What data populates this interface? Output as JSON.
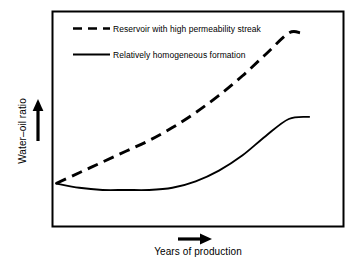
{
  "axes": {
    "y_label": "Water–oil ratio",
    "x_label": "Years of production",
    "y_arrow_icon": "arrow-up-icon",
    "x_arrow_icon": "arrow-right-icon"
  },
  "legend": {
    "entries": [
      {
        "label": "Reservoir with high permeability streak",
        "style": "dashed",
        "color": "#000000"
      },
      {
        "label": "Relatively homogeneous formation",
        "style": "solid",
        "color": "#000000"
      }
    ]
  },
  "chart_data": {
    "type": "line",
    "title": "",
    "subtitle": "",
    "xlabel": "Years of production",
    "ylabel": "Water–oil ratio",
    "xlim": [
      0,
      100
    ],
    "ylim": [
      0,
      100
    ],
    "grid": false,
    "axis_tick_labels": {
      "x": [],
      "y": []
    },
    "legend_position": "top-left-inside",
    "annotations": [],
    "series": [
      {
        "name": "Reservoir with high permeability streak",
        "style": "dashed",
        "color": "#000000",
        "x": [
          0,
          8,
          16,
          24,
          32,
          40,
          48,
          56,
          64,
          72,
          80,
          84
        ],
        "y": [
          20,
          25,
          30,
          35,
          40,
          46,
          53,
          61,
          70,
          80,
          90,
          90
        ]
      },
      {
        "name": "Relatively homogeneous formation",
        "style": "solid",
        "color": "#000000",
        "x": [
          0,
          8,
          16,
          24,
          32,
          40,
          48,
          56,
          64,
          72,
          80,
          87
        ],
        "y": [
          20,
          18,
          17,
          17,
          17,
          18,
          21,
          26,
          33,
          42,
          50,
          51
        ]
      }
    ]
  }
}
